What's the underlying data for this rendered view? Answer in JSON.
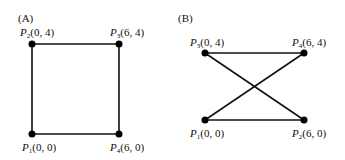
{
  "panels": [
    {
      "label": "(A)",
      "points": [
        {
          "name": "P",
          "sub": "2",
          "coord": "(0, 4)",
          "x": 32,
          "y": 44,
          "lx": 20,
          "ly": 36
        },
        {
          "name": "P",
          "sub": "3",
          "coord": "(6, 4)",
          "x": 119,
          "y": 44,
          "lx": 110,
          "ly": 36
        },
        {
          "name": "P",
          "sub": "1",
          "coord": "(0, 0)",
          "x": 32,
          "y": 134,
          "lx": 22,
          "ly": 151
        },
        {
          "name": "P",
          "sub": "4",
          "coord": "(6, 0)",
          "x": 119,
          "y": 134,
          "lx": 110,
          "ly": 151
        }
      ],
      "edges": [
        [
          0,
          1
        ],
        [
          1,
          3
        ],
        [
          3,
          2
        ],
        [
          2,
          0
        ]
      ]
    },
    {
      "label": "(B)",
      "points": [
        {
          "name": "P",
          "sub": "3",
          "coord": "(0, 4)",
          "x": 205,
          "y": 53,
          "lx": 190,
          "ly": 46
        },
        {
          "name": "P",
          "sub": "4",
          "coord": "(6, 4)",
          "x": 304,
          "y": 53,
          "lx": 292,
          "ly": 46
        },
        {
          "name": "P",
          "sub": "1",
          "coord": "(0, 0)",
          "x": 205,
          "y": 120,
          "lx": 190,
          "ly": 137
        },
        {
          "name": "P",
          "sub": "2",
          "coord": "(6, 0)",
          "x": 304,
          "y": 120,
          "lx": 292,
          "ly": 137
        }
      ],
      "edges": [
        [
          0,
          1
        ],
        [
          2,
          3
        ],
        [
          0,
          3
        ],
        [
          2,
          1
        ]
      ]
    }
  ],
  "panel_label_pos": [
    {
      "x": 18,
      "y": 22
    },
    {
      "x": 178,
      "y": 22
    }
  ]
}
